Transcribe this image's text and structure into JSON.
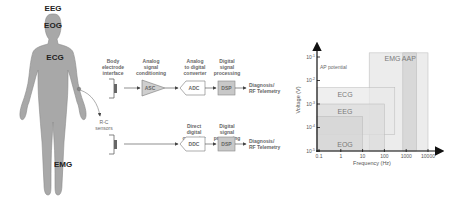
{
  "figure": {
    "body": {
      "labels": [
        "EEG",
        "EOG",
        "ECG",
        "EMG"
      ],
      "fill_color": "#a8a8a8"
    },
    "sensors_label": "R-C\nsensors",
    "pipeline_top": {
      "stage_labels": [
        "Body\nelectrode\ninterface",
        "Analog\nsignal\nconditioning",
        "Analog\nto digital\nconverter",
        "Digital\nsignal\nprocessing"
      ],
      "blocks": [
        "ASC",
        "ADC",
        "DSP"
      ],
      "output": "Diagnosis/\nRF Telemetry"
    },
    "pipeline_bottom": {
      "stage_labels": [
        "Direct\ndigital\nconverter",
        "Digital\nsignal\nprocessing"
      ],
      "blocks": [
        "DDC",
        "DSP"
      ],
      "output": "Diagnosis/\nRF Telemetry"
    }
  },
  "chart_data": {
    "type": "area",
    "title": "",
    "xlabel": "Frequency (Hz)",
    "ylabel": "Voltage (V)",
    "x_scale": "log",
    "y_scale": "log",
    "xlim": [
      0.1,
      10000
    ],
    "ylim": [
      1e-05,
      0.1
    ],
    "x_ticks": [
      "0.1",
      "1",
      "10",
      "100",
      "1000",
      "10000"
    ],
    "y_ticks": [
      "10^-1",
      "10^-2",
      "10^-3",
      "10^-4",
      "10^-5"
    ],
    "annotation": "AP potential",
    "regions": [
      {
        "name": "EMG",
        "freq": [
          20,
          10000
        ],
        "voltage": [
          1e-05,
          0.15
        ]
      },
      {
        "name": "AAP",
        "freq": [
          700,
          3000
        ],
        "voltage": [
          1e-05,
          0.15
        ]
      },
      {
        "name": "ECG",
        "freq": [
          0.05,
          300
        ],
        "voltage": [
          5e-05,
          0.005
        ]
      },
      {
        "name": "EEG",
        "freq": [
          0.05,
          100
        ],
        "voltage": [
          1e-05,
          0.001
        ]
      },
      {
        "name": "EOG",
        "freq": [
          0.05,
          10
        ],
        "voltage": [
          1e-05,
          0.0003
        ]
      }
    ]
  }
}
